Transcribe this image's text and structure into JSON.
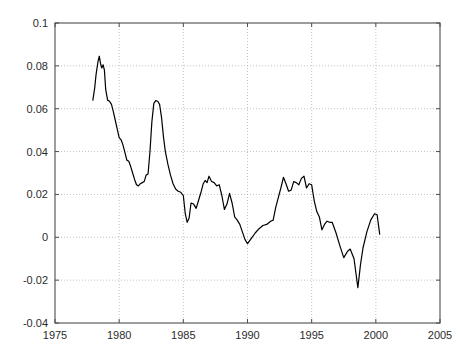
{
  "chart_data": {
    "type": "line",
    "title": "",
    "subtitle": "",
    "xlabel": "",
    "ylabel": "",
    "xlim": [
      1975,
      2005
    ],
    "ylim": [
      -0.04,
      0.1
    ],
    "grid": true,
    "grid_style": "dotted",
    "legend": null,
    "legend_position": "none",
    "xticks": [
      1975,
      1980,
      1985,
      1990,
      1995,
      2000,
      2005
    ],
    "xtick_labels": [
      "1975",
      "1980",
      "1985",
      "1990",
      "1995",
      "2000",
      "2005"
    ],
    "yticks": [
      -0.04,
      -0.02,
      0,
      0.02,
      0.04,
      0.06,
      0.08,
      0.1
    ],
    "ytick_labels": [
      "-0.04",
      "-0.02",
      "0",
      "0.02",
      "0.04",
      "0.06",
      "0.08",
      "0.1"
    ],
    "line_color": "#000000",
    "line_width": 1.2,
    "background_color": "#ffffff",
    "axis_color": "#4d4d4d",
    "grid_color": "#b4b4b4",
    "series": [
      {
        "name": "series-1",
        "color": "#000000",
        "x": [
          1977.95,
          1978.1,
          1978.2,
          1978.35,
          1978.45,
          1978.55,
          1978.65,
          1978.75,
          1978.85,
          1978.95,
          1979.1,
          1979.25,
          1979.4,
          1979.55,
          1979.7,
          1979.85,
          1980.0,
          1980.15,
          1980.3,
          1980.45,
          1980.6,
          1980.75,
          1980.9,
          1981.05,
          1981.2,
          1981.35,
          1981.5,
          1981.65,
          1981.8,
          1981.95,
          1982.1,
          1982.25,
          1982.4,
          1982.55,
          1982.7,
          1982.85,
          1983.0,
          1983.15,
          1983.3,
          1983.45,
          1983.6,
          1983.8,
          1984.0,
          1984.2,
          1984.4,
          1984.6,
          1984.8,
          1985.0,
          1985.15,
          1985.3,
          1985.45,
          1985.6,
          1985.8,
          1986.0,
          1986.2,
          1986.4,
          1986.55,
          1986.7,
          1986.85,
          1987.0,
          1987.2,
          1987.4,
          1987.6,
          1987.8,
          1988.0,
          1988.2,
          1988.4,
          1988.6,
          1988.8,
          1989.0,
          1989.2,
          1989.4,
          1989.6,
          1989.8,
          1990.0,
          1990.3,
          1990.6,
          1990.9,
          1991.2,
          1991.5,
          1991.8,
          1992.0,
          1992.2,
          1992.4,
          1992.6,
          1992.8,
          1993.0,
          1993.2,
          1993.4,
          1993.6,
          1993.8,
          1994.0,
          1994.2,
          1994.4,
          1994.6,
          1994.8,
          1995.0,
          1995.2,
          1995.4,
          1995.6,
          1995.8,
          1996.0,
          1996.2,
          1996.4,
          1996.6,
          1996.9,
          1997.2,
          1997.5,
          1997.8,
          1998.0,
          1998.3,
          1998.6,
          1998.8,
          1999.0,
          1999.3,
          1999.6,
          1999.9,
          2000.1,
          2000.3
        ],
        "y": [
          0.064,
          0.07,
          0.076,
          0.082,
          0.0845,
          0.081,
          0.079,
          0.0805,
          0.078,
          0.069,
          0.064,
          0.0635,
          0.062,
          0.0585,
          0.0545,
          0.0505,
          0.0465,
          0.0455,
          0.043,
          0.0395,
          0.036,
          0.0355,
          0.033,
          0.03,
          0.027,
          0.0245,
          0.024,
          0.025,
          0.0255,
          0.026,
          0.029,
          0.0295,
          0.04,
          0.054,
          0.0625,
          0.0638,
          0.0635,
          0.062,
          0.056,
          0.047,
          0.04,
          0.034,
          0.029,
          0.025,
          0.0225,
          0.0215,
          0.021,
          0.0195,
          0.011,
          0.007,
          0.009,
          0.016,
          0.0155,
          0.0135,
          0.0175,
          0.0215,
          0.025,
          0.0265,
          0.0255,
          0.0285,
          0.026,
          0.0255,
          0.024,
          0.0245,
          0.0195,
          0.013,
          0.0155,
          0.0205,
          0.016,
          0.0095,
          0.008,
          0.006,
          0.0025,
          -0.001,
          -0.003,
          -0.0005,
          0.002,
          0.004,
          0.0055,
          0.006,
          0.0075,
          0.008,
          0.014,
          0.0185,
          0.023,
          0.028,
          0.025,
          0.0215,
          0.022,
          0.026,
          0.0255,
          0.0245,
          0.0275,
          0.0285,
          0.023,
          0.025,
          0.0245,
          0.017,
          0.012,
          0.0095,
          0.0035,
          0.006,
          0.0075,
          0.007,
          0.007,
          0.002,
          -0.004,
          -0.0095,
          -0.0065,
          -0.0055,
          -0.01,
          -0.0235,
          -0.013,
          -0.005,
          0.0025,
          0.008,
          0.011,
          0.0105,
          0.0015
        ]
      }
    ],
    "annotations": []
  },
  "axis": {
    "y_tick_text": {
      "t0": "0.1",
      "t1": "0.08",
      "t2": "0.06",
      "t3": "0.04",
      "t4": "0.02",
      "t5": "0",
      "t6": "-0.02",
      "t7": "-0.04"
    },
    "x_tick_text": {
      "t0": "1975",
      "t1": "1980",
      "t2": "1985",
      "t3": "1990",
      "t4": "1995",
      "t5": "2000",
      "t6": "2005"
    }
  }
}
